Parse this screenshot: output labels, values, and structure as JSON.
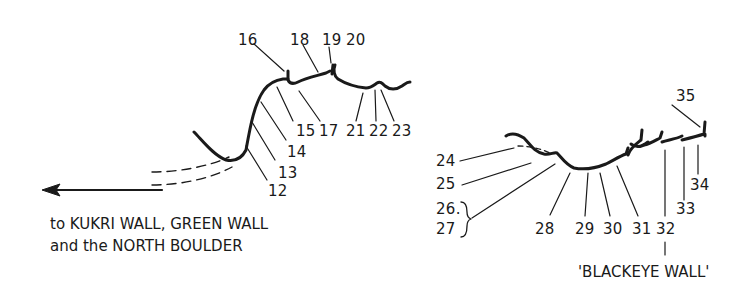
{
  "diagram": {
    "type": "climbing-topo",
    "left_crag": {
      "route_numbers": [
        "12",
        "13",
        "14",
        "15",
        "16",
        "17",
        "18",
        "19",
        "20",
        "21",
        "22",
        "23"
      ],
      "direction_caption": {
        "line1": "to KUKRI WALL, GREEN WALL",
        "line2": "and the NORTH BOULDER"
      },
      "arrow": "left-arrow"
    },
    "right_crag": {
      "route_numbers": [
        "24",
        "25",
        "26.",
        "27",
        "28",
        "29",
        "30",
        "31",
        "32",
        "33",
        "34",
        "35"
      ],
      "wall_name": "'BLACKEYE WALL'"
    },
    "colors": {
      "ink": "#1a1a1a",
      "background": "#ffffff"
    }
  }
}
